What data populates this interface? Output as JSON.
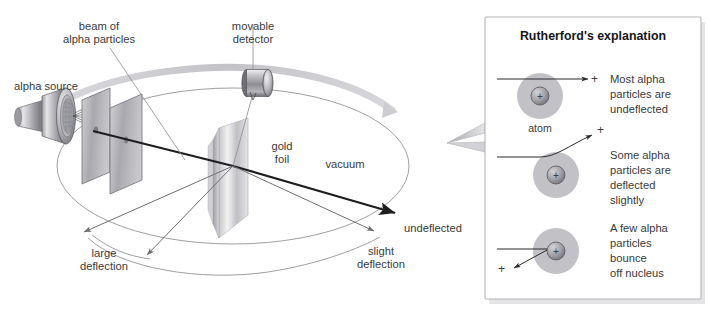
{
  "figure": {
    "background_color": "#ffffff",
    "ink_color": "#3a3a3c"
  },
  "main_diagram": {
    "labels": {
      "alpha_source": "alpha source",
      "beam_of_alpha_particles": "beam of\nalpha particles",
      "beam_line1": "beam of",
      "beam_line2": "alpha particles",
      "movable_detector_line1": "movable",
      "movable_detector_line2": "detector",
      "gold_foil_line1": "gold",
      "gold_foil_line2": "foil",
      "vacuum": "vacuum",
      "undeflected": "undeflected",
      "slight_deflection_line1": "slight",
      "slight_deflection_line2": "deflection",
      "large_deflection_line1": "large",
      "large_deflection_line2": "deflection"
    },
    "colors": {
      "metal_light": "#d9d9dc",
      "metal_mid": "#a9a9ae",
      "metal_dark": "#6e6e74",
      "foil_light": "#e2e2e4",
      "foil_mid": "#bdbdc1",
      "plate_mid": "#b0b0b5",
      "arc_arrow": "#c9c9cd",
      "beam": "#1d1d20"
    }
  },
  "panel": {
    "title": "Rutherford's explanation",
    "atom_label": "atom",
    "plus_symbol": "+",
    "rows": [
      {
        "id": "undeflected",
        "text_lines": [
          "Most alpha",
          "particles are",
          "undeflected"
        ],
        "behavior": "straight-through"
      },
      {
        "id": "slight",
        "text_lines": [
          "Some alpha",
          "particles are",
          "deflected",
          "slightly"
        ],
        "behavior": "small-angle-deflection"
      },
      {
        "id": "bounce",
        "text_lines": [
          "A few alpha",
          "particles",
          "bounce",
          "off nucleus"
        ],
        "behavior": "backscatter"
      }
    ],
    "colors": {
      "border": "#b6b6ba",
      "electron_cloud": "#c2c2c6",
      "nucleus": "#a0a0a6",
      "nucleus_edge": "#5f5f66",
      "shadow": "#e2e2e4"
    }
  }
}
